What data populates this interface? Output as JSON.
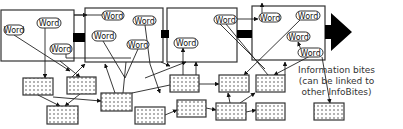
{
  "diagram": {
    "word_label": "Word",
    "caption": {
      "line1": "Information bites",
      "line2": "(can be linked to",
      "line3": "other InfoBites)"
    },
    "colors": {
      "stroke": "#333333",
      "fill_word": "#ffffff",
      "fill_bite": "#ffffff",
      "dot": "#555555",
      "connector": "#000000"
    },
    "pages": [
      {
        "x": 1,
        "y": 10,
        "w": 73,
        "h": 51
      },
      {
        "x": 85,
        "y": 8,
        "w": 78,
        "h": 54
      },
      {
        "x": 167,
        "y": 8,
        "w": 70,
        "h": 54
      },
      {
        "x": 252,
        "y": 6,
        "w": 73,
        "h": 54
      }
    ],
    "words": [
      {
        "x": 4,
        "y": 25,
        "w": 20,
        "h": 10
      },
      {
        "x": 37,
        "y": 18,
        "w": 24,
        "h": 10
      },
      {
        "x": 50,
        "y": 44,
        "w": 22,
        "h": 10
      },
      {
        "x": 102,
        "y": 11,
        "w": 22,
        "h": 9
      },
      {
        "x": 92,
        "y": 31,
        "w": 24,
        "h": 10
      },
      {
        "x": 133,
        "y": 16,
        "w": 23,
        "h": 9
      },
      {
        "x": 127,
        "y": 40,
        "w": 22,
        "h": 9
      },
      {
        "x": 174,
        "y": 38,
        "w": 24,
        "h": 10
      },
      {
        "x": 214,
        "y": 15,
        "w": 23,
        "h": 9
      },
      {
        "x": 259,
        "y": 13,
        "w": 22,
        "h": 9
      },
      {
        "x": 296,
        "y": 11,
        "w": 24,
        "h": 9
      },
      {
        "x": 287,
        "y": 32,
        "w": 23,
        "h": 9
      },
      {
        "x": 298,
        "y": 48,
        "w": 25,
        "h": 9
      }
    ],
    "bites": [
      {
        "x": 23,
        "y": 78,
        "w": 30,
        "h": 17
      },
      {
        "x": 67,
        "y": 77,
        "w": 29,
        "h": 17
      },
      {
        "x": 47,
        "y": 106,
        "w": 31,
        "h": 18
      },
      {
        "x": 101,
        "y": 93,
        "w": 31,
        "h": 18
      },
      {
        "x": 135,
        "y": 107,
        "w": 30,
        "h": 17
      },
      {
        "x": 170,
        "y": 75,
        "w": 29,
        "h": 17
      },
      {
        "x": 177,
        "y": 100,
        "w": 29,
        "h": 17
      },
      {
        "x": 219,
        "y": 75,
        "w": 30,
        "h": 17
      },
      {
        "x": 256,
        "y": 75,
        "w": 29,
        "h": 17
      },
      {
        "x": 216,
        "y": 103,
        "w": 30,
        "h": 17
      },
      {
        "x": 256,
        "y": 103,
        "w": 29,
        "h": 17
      },
      {
        "x": 314,
        "y": 103,
        "w": 30,
        "h": 17
      }
    ]
  }
}
